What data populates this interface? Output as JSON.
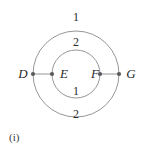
{
  "figure": {
    "caption": "(i)",
    "background_color": "#ffffff",
    "stroke_color": "#8a8a8a",
    "node_color": "#5a5a5a",
    "text_color": "#2b2b2b",
    "geometry": {
      "center_x": 76,
      "center_y": 74,
      "outer_radius": 43,
      "inner_radius": 24
    },
    "nodes": [
      {
        "id": "D",
        "label": "D",
        "x": 33,
        "y": 74
      },
      {
        "id": "E",
        "label": "E",
        "x": 52,
        "y": 74
      },
      {
        "id": "F",
        "label": "F",
        "x": 100,
        "y": 74
      },
      {
        "id": "G",
        "label": "G",
        "x": 119,
        "y": 74
      }
    ],
    "edges": [
      {
        "id": "DE",
        "from": "D",
        "to": "E"
      },
      {
        "id": "FG",
        "from": "F",
        "to": "G"
      }
    ],
    "arc_labels": {
      "top_outer": "1",
      "top_inner": "2",
      "bottom_inner": "1",
      "bottom_outer": "2"
    }
  }
}
